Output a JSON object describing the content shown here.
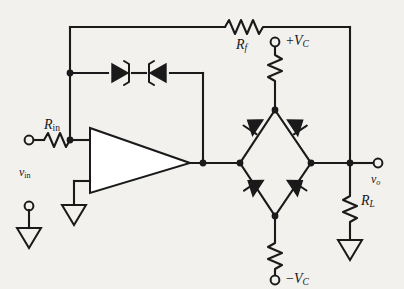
{
  "figure": {
    "background_color": "#f2f1ee",
    "line_color": "#1a1a1a"
  },
  "labels": {
    "r_in": {
      "symbol": "R",
      "subscript": "in"
    },
    "r_f": {
      "symbol": "R",
      "subscript": "f"
    },
    "r_l": {
      "symbol": "R",
      "subscript": "L"
    },
    "v_in": {
      "symbol": "v",
      "subscript": "in"
    },
    "v_o": {
      "symbol": "v",
      "subscript": "o"
    },
    "supply_positive": {
      "sign": "+",
      "symbol": "V",
      "subscript": "C"
    },
    "supply_negative": {
      "sign": "−",
      "symbol": "V",
      "subscript": "C"
    }
  },
  "components": [
    {
      "name": "input-resistor",
      "label": "R_in",
      "type": "resistor",
      "orientation": "horizontal"
    },
    {
      "name": "feedback-resistor",
      "label": "R_f",
      "type": "resistor",
      "orientation": "horizontal"
    },
    {
      "name": "load-resistor",
      "label": "R_L",
      "type": "resistor",
      "orientation": "vertical"
    },
    {
      "name": "positive-supply-resistor",
      "label": "",
      "type": "resistor",
      "orientation": "vertical"
    },
    {
      "name": "negative-supply-resistor",
      "label": "",
      "type": "resistor",
      "orientation": "vertical"
    },
    {
      "name": "zener-diode-left",
      "label": "",
      "type": "zener-diode",
      "direction": "right"
    },
    {
      "name": "zener-diode-right",
      "label": "",
      "type": "zener-diode",
      "direction": "left"
    },
    {
      "name": "bridge-diode-top-left",
      "label": "",
      "type": "diode",
      "direction": "down-left"
    },
    {
      "name": "bridge-diode-top-right",
      "label": "",
      "type": "diode",
      "direction": "down-right"
    },
    {
      "name": "bridge-diode-bottom-left",
      "label": "",
      "type": "diode",
      "direction": "down-right"
    },
    {
      "name": "bridge-diode-bottom-right",
      "label": "",
      "type": "diode",
      "direction": "down-left"
    },
    {
      "name": "operational-amplifier",
      "label": "",
      "type": "op-amp"
    }
  ],
  "terminals": [
    {
      "name": "input-terminal",
      "label": "v_in"
    },
    {
      "name": "input-ground-terminal",
      "label": ""
    },
    {
      "name": "output-terminal",
      "label": "v_o"
    },
    {
      "name": "positive-supply-terminal",
      "label": "+V_C"
    },
    {
      "name": "negative-supply-terminal",
      "label": "-V_C"
    }
  ],
  "grounds": [
    {
      "name": "ground-input-reference"
    },
    {
      "name": "ground-noninverting-input"
    },
    {
      "name": "ground-load"
    }
  ]
}
